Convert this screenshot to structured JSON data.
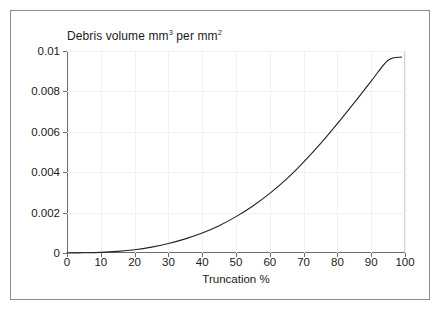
{
  "figure": {
    "border_color": "#8c8c8c",
    "background": "#ffffff"
  },
  "chart_data": {
    "type": "line",
    "title": "Debris volume mm3 per mm2",
    "title_parts": {
      "prefix": "Debris volume mm",
      "sup1": "3",
      "middle": " per mm",
      "sup2": "2"
    },
    "xlabel": "Truncation %",
    "ylabel": "",
    "xlim": [
      0,
      100
    ],
    "ylim": [
      0,
      0.01
    ],
    "grid": true,
    "legend": null,
    "line_color": "#222222",
    "xticks": [
      0,
      10,
      20,
      30,
      40,
      50,
      60,
      70,
      80,
      90,
      100
    ],
    "xticklabels": [
      "0",
      "10",
      "20",
      "30",
      "40",
      "50",
      "60",
      "70",
      "80",
      "90",
      "100"
    ],
    "yticks": [
      0,
      0.002,
      0.004,
      0.006,
      0.008,
      0.01
    ],
    "yticklabels": [
      "0",
      "0.002",
      "0.004",
      "0.006",
      "0.008",
      "0.01"
    ],
    "series": [
      {
        "name": "Debris volume",
        "x": [
          0,
          5,
          10,
          15,
          20,
          25,
          30,
          35,
          40,
          45,
          50,
          55,
          60,
          65,
          70,
          75,
          80,
          85,
          90,
          95,
          99
        ],
        "values": [
          0.0,
          1e-05,
          3e-05,
          8e-05,
          0.00016,
          0.00029,
          0.00047,
          0.0007,
          0.00099,
          0.00135,
          0.0018,
          0.00233,
          0.00295,
          0.00367,
          0.0045,
          0.00541,
          0.0064,
          0.00744,
          0.00851,
          0.00954,
          0.0097
        ]
      }
    ]
  }
}
